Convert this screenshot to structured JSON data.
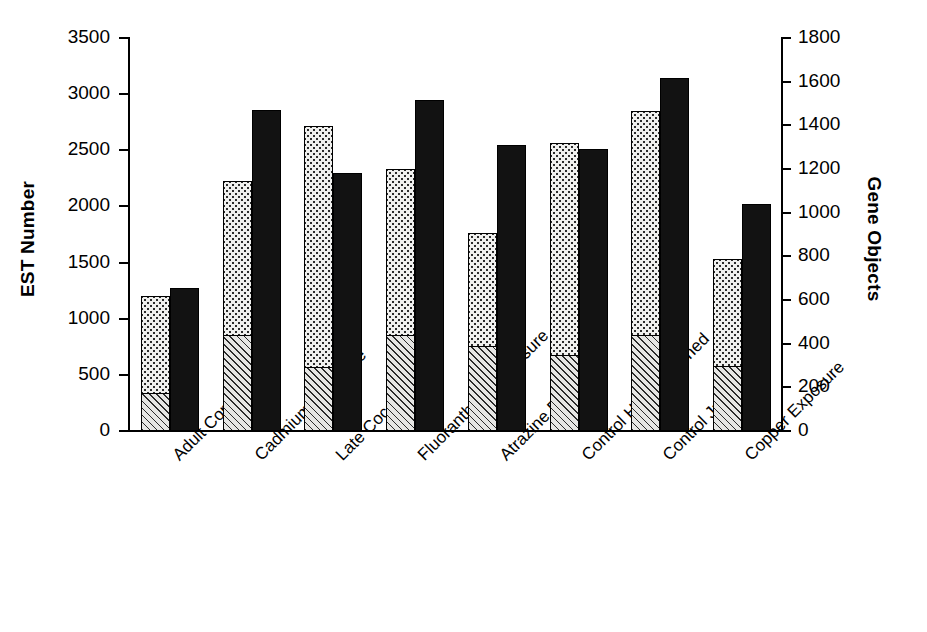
{
  "chart_data": {
    "type": "bar",
    "title": "",
    "subtitle": "",
    "grid": false,
    "legend_position": "none",
    "xlabel": "",
    "ylabel": "EST Number",
    "y2label": "Gene Objects",
    "ylim": [
      0,
      3500
    ],
    "y2lim": [
      0,
      1800
    ],
    "yticks": [
      0,
      500,
      1000,
      1500,
      2000,
      2500,
      3000,
      3500
    ],
    "y2ticks": [
      0,
      200,
      400,
      600,
      800,
      1000,
      1200,
      1400,
      1600,
      1800
    ],
    "categories": [
      "Adult Control",
      "Cadmium Exposure",
      "Late Cocoon",
      "Fluoranthene Exposure",
      "Atrazine Exposure",
      "Control Head Enriched",
      "Control Juvenile",
      "Copper Exposure"
    ],
    "series": [
      {
        "name": "EST Number (hatched lower segment)",
        "axis": "left",
        "pattern": "diagonal-hatch",
        "values": [
          330,
          850,
          560,
          850,
          750,
          670,
          850,
          570
        ]
      },
      {
        "name": "EST Number (dotted upper segment)",
        "axis": "left",
        "pattern": "dotted",
        "stacked_total": [
          1190,
          2215,
          2705,
          2320,
          1755,
          2560,
          2845,
          1525
        ],
        "values": [
          860,
          1365,
          2145,
          1470,
          1005,
          1890,
          1995,
          955
        ]
      },
      {
        "name": "Gene Objects",
        "axis": "right",
        "pattern": "solid-black",
        "values": [
          650,
          1465,
          1175,
          1510,
          1305,
          1285,
          1610,
          1035
        ],
        "values_left_scale": [
          1265,
          2850,
          2285,
          2935,
          2540,
          2500,
          3130,
          2015
        ]
      }
    ]
  },
  "axes": {
    "left_title": "EST Number",
    "right_title": "Gene Objects",
    "left_ticks": [
      "3500",
      "3000",
      "2500",
      "2000",
      "1500",
      "1000",
      "500",
      "0"
    ],
    "right_ticks": [
      "1800",
      "1600",
      "1400",
      "1200",
      "1000",
      "800",
      "600",
      "400",
      "200",
      "0"
    ]
  },
  "colors": {
    "black_bar": "#121212",
    "dotted_fill": "#f0f0ee",
    "hatch_fill": "#e6e6e4",
    "axis": "#000000",
    "background": "#ffffff"
  }
}
